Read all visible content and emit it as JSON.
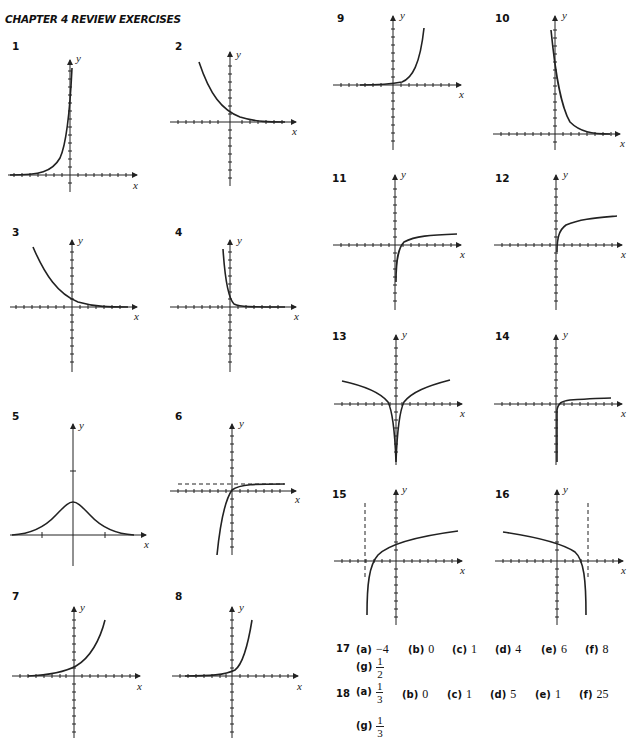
{
  "title": "CHAPTER 4 REVIEW EXERCISES",
  "axis_labels": {
    "x": "x",
    "y": "y"
  },
  "exercises": [
    {
      "number": "1",
      "description": "rapidly increasing exponential curve, near-vertical near y-axis"
    },
    {
      "number": "2",
      "description": "decreasing exponential curve approaching x-axis"
    },
    {
      "number": "3",
      "description": "decreasing exponential curve approaching x-axis"
    },
    {
      "number": "4",
      "description": "steep decreasing exponential curve"
    },
    {
      "number": "5",
      "description": "bell-shaped curve symmetric about y-axis"
    },
    {
      "number": "6",
      "description": "increasing curve with dashed horizontal asymptote above x-axis"
    },
    {
      "number": "7",
      "description": "increasing exponential curve"
    },
    {
      "number": "8",
      "description": "steep increasing exponential curve"
    },
    {
      "number": "9",
      "description": "increasing exponential curve"
    },
    {
      "number": "10",
      "description": "steep decreasing exponential curve"
    },
    {
      "number": "11",
      "description": "logarithmic curve"
    },
    {
      "number": "12",
      "description": "logarithmic curve shifted up"
    },
    {
      "number": "13",
      "description": "logarithm of absolute value, symmetric about y-axis"
    },
    {
      "number": "14",
      "description": "flat logarithmic curve"
    },
    {
      "number": "15",
      "description": "logarithmic curve with dashed vertical asymptote left of y-axis"
    },
    {
      "number": "16",
      "description": "reflected logarithmic curve with dashed vertical asymptote right of y-axis"
    }
  ],
  "answers": {
    "q17": {
      "number": "17",
      "parts": [
        {
          "label": "(a)",
          "value": "−4"
        },
        {
          "label": "(b)",
          "value": "0"
        },
        {
          "label": "(c)",
          "value": "1"
        },
        {
          "label": "(d)",
          "value": "4"
        },
        {
          "label": "(e)",
          "value": "6"
        },
        {
          "label": "(f)",
          "value": "8"
        },
        {
          "label": "(g)",
          "numerator": "1",
          "denominator": "2"
        }
      ]
    },
    "q18": {
      "number": "18",
      "parts": [
        {
          "label": "(a)",
          "numerator": "1",
          "denominator": "3"
        },
        {
          "label": "(b)",
          "value": "0"
        },
        {
          "label": "(c)",
          "value": "1"
        },
        {
          "label": "(d)",
          "value": "5"
        },
        {
          "label": "(e)",
          "value": "1"
        },
        {
          "label": "(f)",
          "value": "25"
        },
        {
          "label": "(g)",
          "numerator": "1",
          "denominator": "3"
        }
      ]
    }
  }
}
